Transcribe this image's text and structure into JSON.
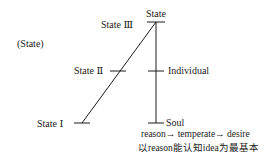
{
  "diagram": {
    "top_label": "State",
    "side_label": "(State)",
    "left_levels": [
      {
        "label": "State Ⅲ"
      },
      {
        "label": "State Ⅱ"
      },
      {
        "label": "State Ⅰ"
      }
    ],
    "right_levels": [
      {
        "label": "Individual"
      },
      {
        "label": "Soul"
      }
    ],
    "caption_line1": "reason→ temperate→ desire",
    "caption_line2": "以reason能认知idea为最基本",
    "line_color": "#1a1a1a"
  }
}
